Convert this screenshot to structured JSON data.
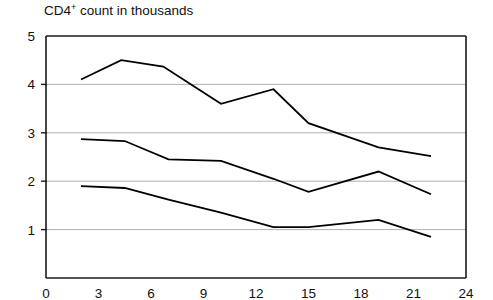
{
  "chart_data": {
    "type": "line",
    "title": "CD4+ count in thousands",
    "title_main": "CD4",
    "title_sup": "+",
    "title_rest": " count in thousands",
    "xlabel": "",
    "ylabel": "",
    "xlim": [
      0,
      24
    ],
    "ylim": [
      0,
      5
    ],
    "xticks": [
      0,
      3,
      6,
      9,
      12,
      15,
      18,
      21,
      24
    ],
    "yticks": [
      0,
      1,
      2,
      3,
      4,
      5
    ],
    "xtick_labels": [
      "0",
      "3",
      "6",
      "9",
      "12",
      "15",
      "18",
      "21",
      "24"
    ],
    "ytick_labels": [
      "0",
      "1",
      "2",
      "3",
      "4",
      "5"
    ],
    "grid": "horizontal",
    "gridlines_at": [
      1,
      2,
      3,
      4
    ],
    "legend": "none",
    "line_color": "#000000",
    "grid_color": "#b0b0b0",
    "axis_color": "#1a1a1a",
    "series": [
      {
        "name": "upper",
        "x": [
          2,
          4.3,
          6.7,
          10,
          13,
          15,
          19,
          22
        ],
        "values": [
          4.1,
          4.5,
          4.37,
          3.6,
          3.9,
          3.2,
          2.7,
          2.52
        ]
      },
      {
        "name": "middle",
        "x": [
          2,
          4.5,
          7,
          10,
          13,
          15,
          19,
          22
        ],
        "values": [
          2.87,
          2.83,
          2.45,
          2.42,
          2.05,
          1.78,
          2.2,
          1.73
        ]
      },
      {
        "name": "lower",
        "x": [
          2,
          4.5,
          7,
          10,
          13,
          15,
          19,
          22
        ],
        "values": [
          1.9,
          1.86,
          1.62,
          1.35,
          1.05,
          1.05,
          1.2,
          0.85
        ]
      }
    ]
  }
}
